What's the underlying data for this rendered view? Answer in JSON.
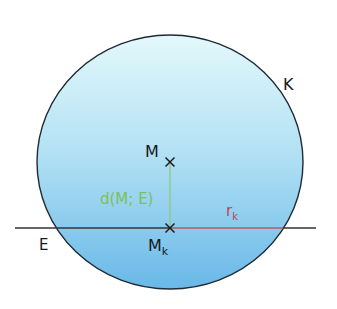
{
  "diagram": {
    "colors": {
      "sphere_fill_top": "#e3f8fb",
      "sphere_fill_mid": "#b4e2f4",
      "sphere_fill_bottom": "#69b8e8",
      "outline": "#1e2a35",
      "plane_line": "#333333",
      "distance_segment": "#8fc87a",
      "distance_label": "#7cbf5e",
      "radius_segment": "#b55a5a",
      "radius_label": "#c0454d",
      "text": "#1a1a1a"
    },
    "labels": {
      "sphere": "K",
      "plane": "E",
      "center": "M",
      "circle_center": "M",
      "circle_center_sub": "k",
      "distance": "d(M; E)",
      "radius": "r",
      "radius_sub": "k"
    },
    "geometry": {
      "sphere_center": [
        170,
        162
      ],
      "sphere_rx": 133,
      "sphere_ry": 127,
      "plane_y": 228,
      "plane_x_start": 15,
      "plane_x_end": 316,
      "point_M": [
        170,
        162
      ],
      "point_Mk": [
        170,
        228
      ],
      "radius_end_x": 283
    }
  }
}
